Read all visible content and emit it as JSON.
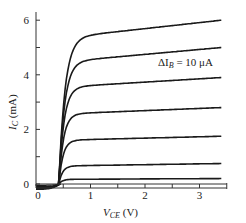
{
  "chart_data": {
    "type": "line",
    "title": "",
    "xlabel": "V_CE (V)",
    "ylabel": "I_C (mA)",
    "xlabel_main": "V",
    "xlabel_sub": "CE",
    "xlabel_unit": " (V)",
    "ylabel_main": "I",
    "ylabel_sub": "C",
    "ylabel_unit": " (mA)",
    "xlim": [
      0,
      3.5
    ],
    "ylim": [
      0,
      6.3
    ],
    "x_ticks": [
      0,
      1,
      2,
      3
    ],
    "x_minor_ticks": [
      0.5,
      1.5,
      2.5
    ],
    "y_ticks": [
      0,
      2,
      4,
      6
    ],
    "y_minor_ticks": [
      1,
      3,
      5
    ],
    "grid": false,
    "annotation": {
      "text_main": "ΔI",
      "text_sub": "B",
      "text_rest": " = 10 μA",
      "full": "ΔI_B = 10 μA",
      "x": 2.0,
      "y": 4.55
    },
    "series": [
      {
        "name": "IB step 7",
        "saturation_ic": 6.0,
        "knee_v": 0.55,
        "slope": 0.22
      },
      {
        "name": "IB step 6",
        "saturation_ic": 5.0,
        "knee_v": 0.55,
        "slope": 0.18
      },
      {
        "name": "IB step 5",
        "saturation_ic": 3.9,
        "knee_v": 0.55,
        "slope": 0.12
      },
      {
        "name": "IB step 4",
        "saturation_ic": 2.8,
        "knee_v": 0.55,
        "slope": 0.08
      },
      {
        "name": "IB step 3",
        "saturation_ic": 1.75,
        "knee_v": 0.55,
        "slope": 0.05
      },
      {
        "name": "IB step 2",
        "saturation_ic": 0.75,
        "knee_v": 0.55,
        "slope": 0.03
      },
      {
        "name": "IB step 1",
        "saturation_ic": 0.2,
        "knee_v": 0.55,
        "slope": 0.01
      }
    ],
    "x_end": 3.4,
    "negative_offsets": [
      -0.05,
      -0.1,
      -0.15,
      -0.2
    ]
  },
  "colors": {
    "line": "#1a1a1a",
    "axis": "#333333",
    "background": "#ffffff"
  }
}
